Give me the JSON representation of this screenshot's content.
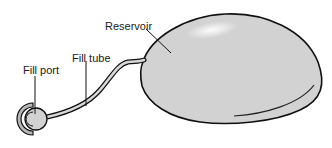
{
  "diagram": {
    "labels": {
      "reservoir": "Reservoir",
      "fill_tube": "Fill tube",
      "fill_port": "Fill port"
    },
    "colors": {
      "fill": "#d2d2d2",
      "outline": "#111111",
      "highlight": "#f2f2f2"
    }
  }
}
